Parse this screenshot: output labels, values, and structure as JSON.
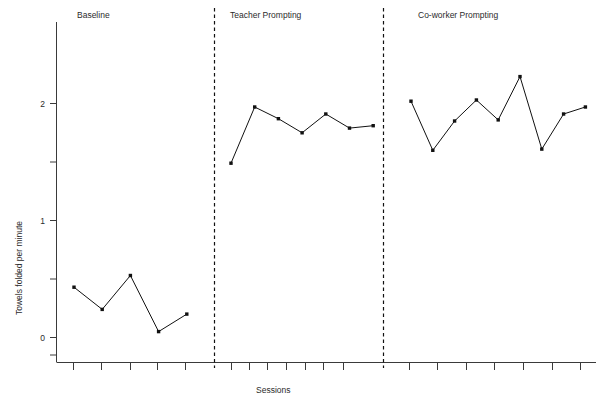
{
  "chart_data": {
    "type": "line",
    "title": "",
    "subtitle": "",
    "xlabel": "Sessions",
    "ylabel": "Towels folded per minute",
    "grid": false,
    "legend_position": "none",
    "ylim": [
      -0.25,
      2.55
    ],
    "ytick_values": [
      0,
      1,
      2
    ],
    "ytick_labels": [
      "0",
      "1",
      "2"
    ],
    "yminor_tick_values": [
      0.5,
      1.5
    ],
    "xtick_labels": [],
    "phases": [
      {
        "name": "Baseline",
        "label": "Baseline",
        "x": [
          1,
          2,
          3,
          4,
          5
        ],
        "values": [
          0.43,
          0.24,
          0.53,
          0.05,
          0.2
        ]
      },
      {
        "name": "Teacher Prompting",
        "label": "Teacher Prompting",
        "x": [
          6,
          7,
          8,
          9,
          10,
          11,
          12
        ],
        "values": [
          1.49,
          1.97,
          1.87,
          1.75,
          1.91,
          1.79,
          1.81
        ]
      },
      {
        "name": "Co-worker Prompting",
        "label": "Co-worker Prompting",
        "x": [
          13,
          14,
          15,
          16,
          17,
          18,
          19,
          20,
          21
        ],
        "values": [
          2.02,
          1.6,
          1.85,
          2.03,
          1.86,
          2.23,
          1.61,
          1.91,
          1.97
        ]
      }
    ],
    "phase_dividers": [
      5.5,
      12.5
    ],
    "colors": {
      "line": "#111111",
      "marker": "#111111",
      "axis": "#3a3a3a",
      "divider": "#111111",
      "text": "#2b2b2b",
      "background": "#ffffff"
    }
  },
  "axes": {
    "y_title": "Towels folded per minute",
    "x_title": "Sessions",
    "y_labels": [
      "2",
      "1",
      "0"
    ]
  },
  "phase_headers": {
    "baseline": "Baseline",
    "teacher": "Teacher Prompting",
    "coworker": "Co-worker Prompting"
  }
}
